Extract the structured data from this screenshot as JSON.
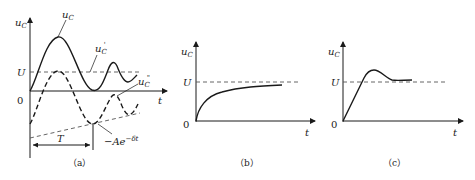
{
  "figure": {
    "panels": [
      {
        "id": "a",
        "caption": "（a）",
        "y_axis_label": "u",
        "y_axis_sub": "C",
        "x_axis_label": "t",
        "origin_label": "0",
        "level_label": "U",
        "curves": {
          "total": {
            "label": "u",
            "sub": "C",
            "sup": ""
          },
          "steady": {
            "label": "u",
            "sub": "C",
            "sup": "'"
          },
          "transient": {
            "label": "u",
            "sub": "C",
            "sup": "\""
          },
          "envelope": {
            "label": "−Ae",
            "sup": "−δt"
          }
        },
        "period_label": "T"
      },
      {
        "id": "b",
        "caption": "（b）",
        "y_axis_label": "u",
        "y_axis_sub": "C",
        "x_axis_label": "t",
        "origin_label": "0",
        "level_label": "U"
      },
      {
        "id": "c",
        "caption": "（c）",
        "y_axis_label": "u",
        "y_axis_sub": "C",
        "x_axis_label": "t",
        "origin_label": "0",
        "level_label": "U"
      }
    ]
  }
}
